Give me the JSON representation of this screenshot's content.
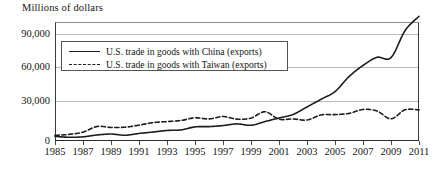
{
  "chart_data": {
    "type": "line",
    "title": "Millions of dollars",
    "xlabel": "",
    "ylabel": "Millions of dollars",
    "ylim": [
      0,
      100000
    ],
    "yticks": [
      0,
      30000,
      60000,
      90000
    ],
    "ytick_labels": [
      "0",
      "30,000",
      "60,000",
      "90,000"
    ],
    "grid": true,
    "legend_position": "upper-left-inside",
    "x": [
      1985,
      1986,
      1987,
      1988,
      1989,
      1990,
      1991,
      1992,
      1993,
      1994,
      1995,
      1996,
      1997,
      1998,
      1999,
      2000,
      2001,
      2002,
      2003,
      2004,
      2005,
      2006,
      2007,
      2008,
      2009,
      2010,
      2011
    ],
    "xtick_labels": [
      "1985",
      "1987",
      "1989",
      "1991",
      "1993",
      "1995",
      "1997",
      "1999",
      "2001",
      "2003",
      "2005",
      "2007",
      "2009",
      "2011"
    ],
    "series": [
      {
        "name": "U.S. trade in goods with China (exports)",
        "style": "solid",
        "values": [
          3856,
          3106,
          3497,
          5017,
          5807,
          4807,
          6287,
          7470,
          8763,
          9282,
          11754,
          11993,
          12862,
          14241,
          13111,
          16185,
          19182,
          22128,
          28368,
          34744,
          41192,
          53673,
          62937,
          69733,
          69497,
          91911,
          103940
        ]
      },
      {
        "name": "U.S. trade in goods with Taiwan (exports)",
        "style": "dashed",
        "values": [
          4700,
          5500,
          7400,
          12100,
          11300,
          11500,
          13200,
          15300,
          16200,
          17100,
          19300,
          18400,
          20400,
          18200,
          19100,
          24400,
          18200,
          18400,
          17500,
          21700,
          22000,
          23000,
          26300,
          25000,
          18500,
          26000,
          25900
        ]
      }
    ]
  },
  "legend": {
    "items": [
      {
        "label": "U.S. trade in goods with China (exports)",
        "style": "solid"
      },
      {
        "label": "U.S. trade in goods with Taiwan (exports)",
        "style": "dashed"
      }
    ]
  }
}
